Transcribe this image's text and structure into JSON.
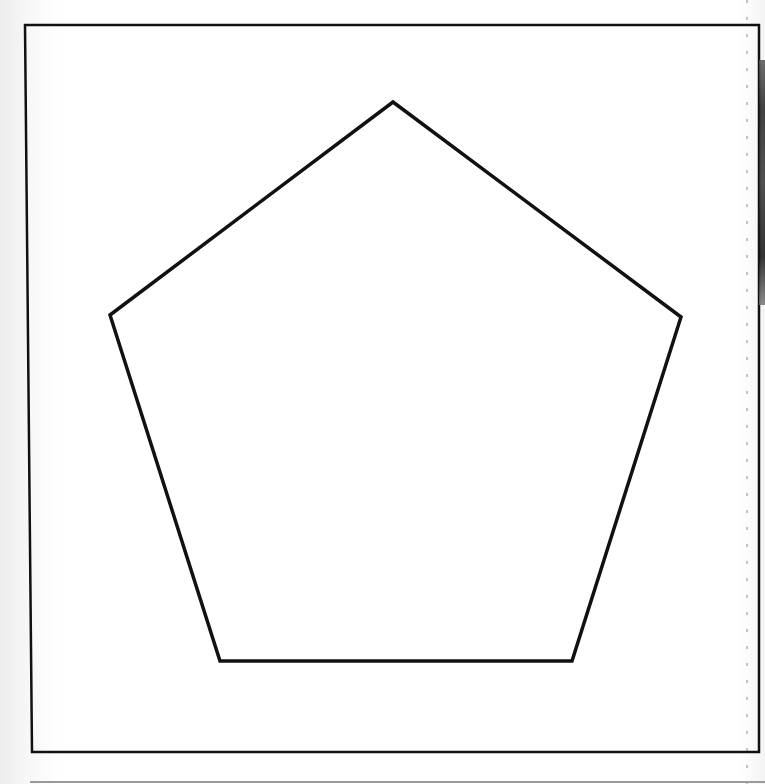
{
  "diagram": {
    "type": "shape",
    "shape": "pentagon",
    "stroke_color": "#111111",
    "fill_color": "#ffffff",
    "vertices": [
      {
        "x": 393,
        "y": 102
      },
      {
        "x": 681,
        "y": 317
      },
      {
        "x": 572,
        "y": 661
      },
      {
        "x": 220,
        "y": 661
      },
      {
        "x": 110,
        "y": 315
      }
    ]
  },
  "frame": {
    "stroke_color": "#111111",
    "corners": [
      {
        "x": 25,
        "y": 25
      },
      {
        "x": 759,
        "y": 25
      },
      {
        "x": 759,
        "y": 752
      },
      {
        "x": 32,
        "y": 752
      }
    ]
  },
  "colors": {
    "background": "#ffffff",
    "line": "#111111",
    "dashed_guide": "#8a8a8a"
  }
}
